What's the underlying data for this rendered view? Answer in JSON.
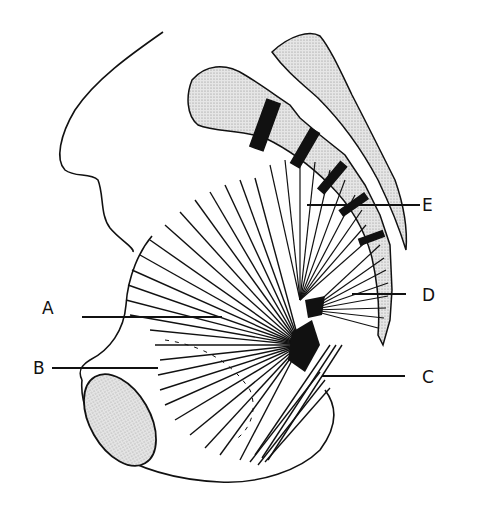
{
  "figure": {
    "labels": [
      {
        "id": "A",
        "text": "A",
        "x": 42,
        "y": 307
      },
      {
        "id": "B",
        "text": "B",
        "x": 33,
        "y": 359
      },
      {
        "id": "C",
        "text": "C",
        "x": 422,
        "y": 369
      },
      {
        "id": "D",
        "text": "D",
        "x": 422,
        "y": 287
      },
      {
        "id": "E",
        "text": "E",
        "x": 422,
        "y": 197
      }
    ],
    "colors": {
      "ink": "#111111",
      "bone_fill": "#d9d9d9",
      "background": "#ffffff"
    }
  }
}
